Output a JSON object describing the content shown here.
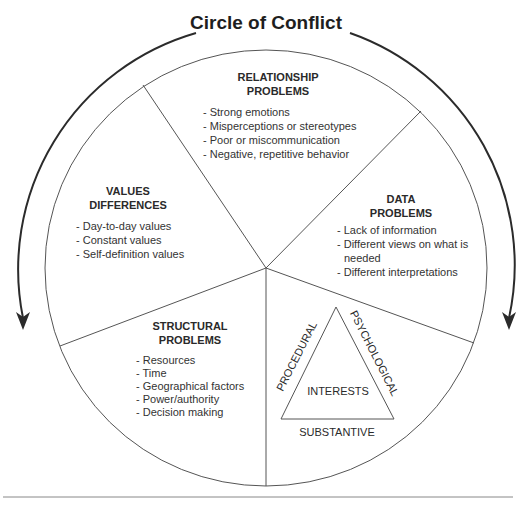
{
  "title": "Circle of Conflict",
  "sections": {
    "relationship": {
      "heading": [
        "RELATIONSHIP",
        "PROBLEMS"
      ],
      "items": [
        "- Strong emotions",
        "- Misperceptions or stereotypes",
        "- Poor or miscommunication",
        "- Negative, repetitive behavior"
      ]
    },
    "values": {
      "heading": [
        "VALUES",
        "DIFFERENCES"
      ],
      "items": [
        "- Day-to-day values",
        "- Constant values",
        "- Self-definition values"
      ]
    },
    "data": {
      "heading": [
        "DATA",
        "PROBLEMS"
      ],
      "items": [
        "- Lack of information",
        "- Different views on what is",
        "  needed",
        "- Different interpretations"
      ]
    },
    "structural": {
      "heading": [
        "STRUCTURAL",
        "PROBLEMS"
      ],
      "items": [
        "- Resources",
        "- Time",
        "- Geographical factors",
        "- Power/authority",
        "- Decision making"
      ]
    },
    "interests": {
      "center": "INTERESTS",
      "left_side": "PROCEDURAL",
      "right_side": "PSYCHOLOGICAL",
      "bottom_side": "SUBSTANTIVE"
    }
  },
  "colors": {
    "lines": "#555555",
    "text": "#333333",
    "arrows": "#2b2b2b"
  }
}
